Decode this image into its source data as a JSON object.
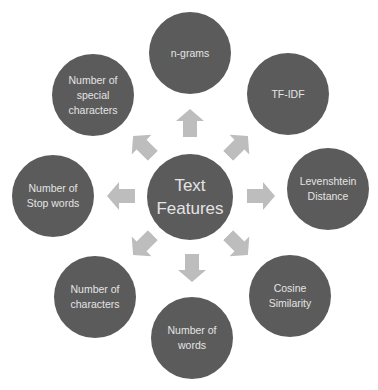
{
  "diagram": {
    "type": "radial",
    "colors": {
      "node": "#5b5b5b",
      "node_text": "#e4e4e4",
      "arrow": "#bdbdbd",
      "background": "#ffffff"
    },
    "center": {
      "label": "Text\nFeatures"
    },
    "nodes": [
      {
        "id": "n-grams",
        "label": "n-grams"
      },
      {
        "id": "tf-idf",
        "label": "TF-IDF"
      },
      {
        "id": "levenshtein",
        "label": "Levenshtein\nDistance"
      },
      {
        "id": "cosine",
        "label": "Cosine\nSimilarity"
      },
      {
        "id": "num-words",
        "label": "Number of\nwords"
      },
      {
        "id": "num-chars",
        "label": "Number of\ncharacters"
      },
      {
        "id": "num-stop-words",
        "label": "Number of\nStop words"
      },
      {
        "id": "num-special-chars",
        "label": "Number of\nspecial\ncharacters"
      }
    ],
    "arrows": [
      "up",
      "up-right",
      "right",
      "down-right",
      "down",
      "down-left",
      "left",
      "up-left"
    ]
  }
}
